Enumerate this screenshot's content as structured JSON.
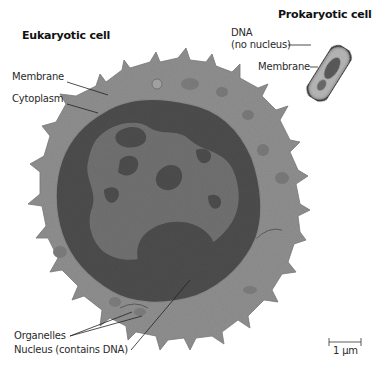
{
  "figure": {
    "eukaryotic": {
      "title": "Eukaryotic cell",
      "labels": {
        "membrane": "Membrane",
        "cytoplasm": "Cytoplasm",
        "organelles": "Organelles",
        "nucleus": "Nucleus (contains DNA)"
      }
    },
    "prokaryotic": {
      "title": "Prokaryotic cell",
      "labels": {
        "dna_line1": "DNA",
        "dna_line2": "(no nucleus)",
        "membrane": "Membrane"
      }
    },
    "scale_bar": {
      "label": "1 µm"
    },
    "colors": {
      "background": "#ffffff",
      "cytoplasm": "#8f8f8f",
      "nucleus_dark": "#4a4a4a",
      "nucleus_light": "#6e6e6e",
      "leader_lines": "#222222"
    }
  }
}
